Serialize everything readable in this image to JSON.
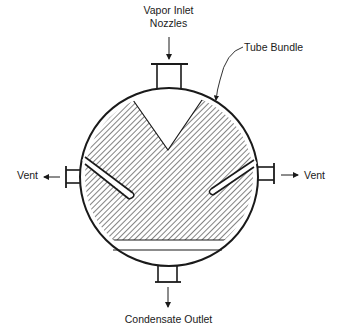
{
  "diagram": {
    "labels": {
      "vapor_inlet_line1": "Vapor Inlet",
      "vapor_inlet_line2": "Nozzles",
      "tube_bundle": "Tube Bundle",
      "vent_left": "Vent",
      "vent_right": "Vent",
      "condensate_outlet": "Condensate Outlet"
    },
    "components": [
      "shell",
      "tube-bundle",
      "vapor-inlet-nozzle",
      "vent-nozzle-left",
      "vent-nozzle-right",
      "condensate-outlet-nozzle",
      "vent-baffle-left",
      "vent-baffle-right"
    ],
    "colors": {
      "line": "#1a1a1a",
      "background": "#ffffff"
    }
  }
}
